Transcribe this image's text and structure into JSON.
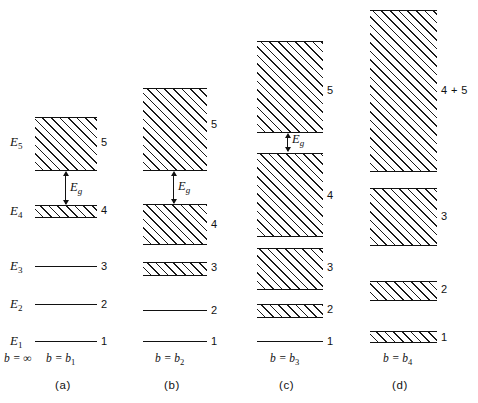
{
  "figure": {
    "energy_labels": [
      {
        "text": "E",
        "sub": "5"
      },
      {
        "text": "E",
        "sub": "4"
      },
      {
        "text": "E",
        "sub": "3"
      },
      {
        "text": "E",
        "sub": "2"
      },
      {
        "text": "E",
        "sub": "1"
      }
    ],
    "gap_symbol": {
      "text": "E",
      "sub": "g"
    },
    "infinity_axis": {
      "text": "b = ",
      "value": "∞"
    }
  },
  "panels": [
    {
      "id": "a",
      "panel_label": "(a)",
      "spacing_label": {
        "text": "b = b",
        "sub": "1"
      },
      "bands": [
        {
          "number": "5",
          "kind": "band"
        },
        {
          "number": "4",
          "kind": "band"
        }
      ],
      "levels": [
        {
          "number": "3",
          "kind": "line"
        },
        {
          "number": "2",
          "kind": "line"
        },
        {
          "number": "1",
          "kind": "line"
        }
      ],
      "has_gap_arrow": true
    },
    {
      "id": "b",
      "panel_label": "(b)",
      "spacing_label": {
        "text": "b = b",
        "sub": "2"
      },
      "bands": [
        {
          "number": "5",
          "kind": "band"
        },
        {
          "number": "4",
          "kind": "band"
        },
        {
          "number": "3",
          "kind": "band"
        }
      ],
      "levels": [
        {
          "number": "2",
          "kind": "line"
        },
        {
          "number": "1",
          "kind": "line"
        }
      ],
      "has_gap_arrow": true
    },
    {
      "id": "c",
      "panel_label": "(c)",
      "spacing_label": {
        "text": "b = b",
        "sub": "3"
      },
      "bands": [
        {
          "number": "5",
          "kind": "band"
        },
        {
          "number": "4",
          "kind": "band"
        },
        {
          "number": "3",
          "kind": "band"
        },
        {
          "number": "2",
          "kind": "band"
        }
      ],
      "levels": [
        {
          "number": "1",
          "kind": "line"
        }
      ],
      "has_gap_arrow": true
    },
    {
      "id": "d",
      "panel_label": "(d)",
      "spacing_label": {
        "text": "b = b",
        "sub": "4"
      },
      "bands": [
        {
          "number": "4 + 5",
          "kind": "band"
        },
        {
          "number": "3",
          "kind": "band"
        },
        {
          "number": "2",
          "kind": "band"
        },
        {
          "number": "1",
          "kind": "band"
        }
      ],
      "levels": [],
      "has_gap_arrow": false
    }
  ],
  "colors": {
    "ink": "#111111",
    "paper": "#ffffff"
  }
}
